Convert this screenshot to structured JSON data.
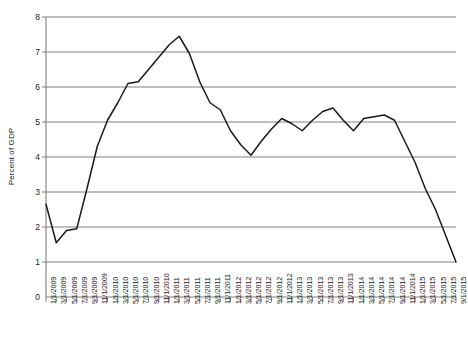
{
  "chart_data": {
    "type": "line",
    "title": "",
    "xlabel": "",
    "ylabel": "Percent of GDP",
    "ylim": [
      0,
      8
    ],
    "ytick_values": [
      0,
      1,
      2,
      3,
      4,
      5,
      6,
      7,
      8
    ],
    "grid": true,
    "legend": "none",
    "line_color": "#1a1a1a",
    "grid_color": "#808080",
    "axis_color": "#808080",
    "categories": [
      "1/1/2009",
      "3/1/2009",
      "5/1/2009",
      "7/1/2009",
      "9/1/2009",
      "11/1/2009",
      "1/1/2010",
      "3/1/2010",
      "5/1/2010",
      "7/1/2010",
      "9/1/2010",
      "11/1/2010",
      "1/1/2011",
      "3/1/2011",
      "5/1/2011",
      "7/1/2011",
      "9/1/2011",
      "11/1/2011",
      "1/1/2012",
      "3/1/2012",
      "5/1/2012",
      "7/1/2012",
      "9/1/2012",
      "11/1/2012",
      "1/1/2013",
      "3/1/2013",
      "5/1/2013",
      "7/1/2013",
      "9/1/2013",
      "11/1/2013",
      "1/1/2014",
      "3/1/2014",
      "5/1/2014",
      "7/1/2014",
      "9/1/2014",
      "11/1/2014",
      "1/1/2015",
      "3/1/2015",
      "5/1/2015",
      "7/1/2015",
      "9/1/2015"
    ],
    "values": [
      2.65,
      1.55,
      1.9,
      1.95,
      3.1,
      4.3,
      5.05,
      5.55,
      6.1,
      6.15,
      6.5,
      6.85,
      7.2,
      7.45,
      6.95,
      6.15,
      5.55,
      5.35,
      4.75,
      4.35,
      4.05,
      4.45,
      4.8,
      5.1,
      4.95,
      4.75,
      5.05,
      5.3,
      5.4,
      5.05,
      4.75,
      5.1,
      5.15,
      5.2,
      5.05,
      4.45,
      3.85,
      3.1,
      2.5,
      1.75,
      1.0
    ]
  }
}
